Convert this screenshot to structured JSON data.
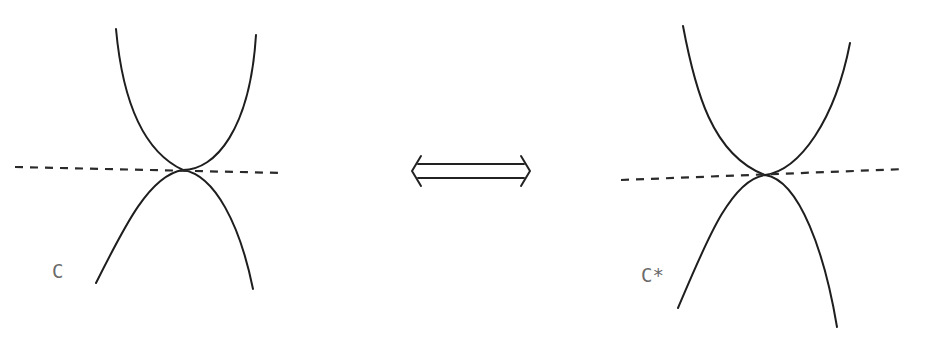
{
  "figure": {
    "left_panel": {
      "label": "C"
    },
    "right_panel": {
      "label": "C*"
    },
    "center_symbol": "double-arrow-equivalence"
  },
  "colors": {
    "ink": "#1e1e1e",
    "label": "#6a6a6a",
    "background": "#ffffff"
  }
}
